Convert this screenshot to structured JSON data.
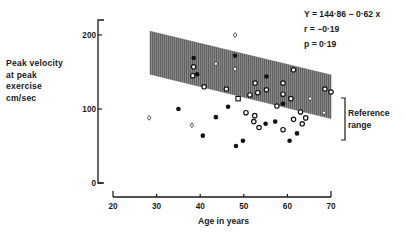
{
  "chart_data": {
    "type": "scatter",
    "title": "",
    "xlabel": "Age in years",
    "ylabel_lines": [
      "Peak velocity",
      "at peak",
      "exercise",
      "cm/sec"
    ],
    "ylabel": "Peak velocity at peak exercise cm/sec",
    "xlim": [
      20,
      70
    ],
    "ylim": [
      0,
      200
    ],
    "x_ticks": [
      20,
      30,
      40,
      50,
      60,
      70
    ],
    "y_ticks": [
      0,
      100,
      200
    ],
    "grid": false,
    "annotations": {
      "equation": "Y = 144·86 − 0·62 x",
      "r": "r = −0·19",
      "p": "p = 0·19",
      "reference_label_lines": [
        "Reference",
        "range"
      ]
    },
    "reference_band": {
      "x_start": 28.5,
      "x_end": 70,
      "upper": [
        [
          28.5,
          205
        ],
        [
          70,
          146
        ]
      ],
      "lower": [
        [
          28.5,
          147
        ],
        [
          70,
          87
        ]
      ],
      "fill": "#7a7a7a"
    },
    "series": [
      {
        "name": "open circles",
        "marker": "open-circle",
        "points": [
          [
            38.5,
            157
          ],
          [
            38.3,
            145
          ],
          [
            61.4,
            153
          ],
          [
            52.6,
            135
          ],
          [
            59,
            135
          ],
          [
            40.9,
            130
          ],
          [
            46,
            127
          ],
          [
            55.2,
            126
          ],
          [
            53.2,
            122
          ],
          [
            59,
            120
          ],
          [
            68.6,
            127
          ],
          [
            70,
            123
          ],
          [
            51.4,
            119
          ],
          [
            60.8,
            114
          ],
          [
            57.6,
            104
          ],
          [
            63,
            96
          ],
          [
            50.5,
            95
          ],
          [
            52.5,
            91
          ],
          [
            64.2,
            88
          ],
          [
            52.3,
            83
          ],
          [
            61.4,
            86
          ],
          [
            63.4,
            80
          ],
          [
            53.5,
            75
          ],
          [
            59,
            72
          ]
        ]
      },
      {
        "name": "open squares",
        "marker": "open-square",
        "points": [
          [
            48.7,
            114
          ]
        ]
      },
      {
        "name": "filled circles",
        "marker": "filled-circle",
        "points": [
          [
            48,
            172
          ],
          [
            38.5,
            169
          ],
          [
            39.3,
            147
          ],
          [
            55.2,
            144
          ],
          [
            59,
            107
          ],
          [
            35,
            100
          ],
          [
            46.4,
            103
          ],
          [
            43.6,
            89
          ],
          [
            57.2,
            83
          ],
          [
            55,
            80
          ],
          [
            40.6,
            64
          ],
          [
            62.2,
            67
          ],
          [
            49.8,
            57
          ],
          [
            60.5,
            57
          ],
          [
            48.2,
            50
          ]
        ]
      },
      {
        "name": "open diamonds",
        "marker": "open-diamond",
        "points": [
          [
            48,
            200
          ],
          [
            43.6,
            161
          ],
          [
            48,
            154
          ],
          [
            65.2,
            114
          ],
          [
            68.4,
            95
          ],
          [
            28.3,
            88
          ],
          [
            38.1,
            78
          ]
        ]
      }
    ]
  }
}
